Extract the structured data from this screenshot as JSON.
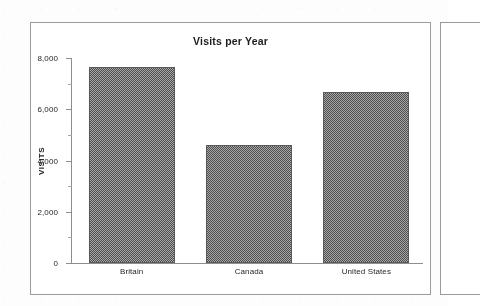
{
  "document": {
    "kind": "scanned-bar-chart",
    "frame_border_color": "#9b9b9b",
    "paper_color": "#fdfdfd"
  },
  "chart_data": {
    "type": "bar",
    "title": "Visits per Year",
    "xlabel": "",
    "ylabel": "VISITS",
    "categories": [
      "Britain",
      "Canada",
      "United States"
    ],
    "values": [
      7630,
      4600,
      6670
    ],
    "ylim": [
      0,
      8000
    ],
    "ytick_labels": [
      "0",
      "2,000",
      "4,000",
      "6,000",
      "8,000"
    ],
    "ytick_values": [
      0,
      2000,
      4000,
      6000,
      8000
    ],
    "yminor_values": [
      1000,
      3000,
      5000,
      7000
    ],
    "grid": false,
    "legend": false,
    "bar_fill": "#a9a9a9",
    "bar_edge": "#5a5a5a",
    "axis_color": "#8e8e8e"
  },
  "panels": {
    "main_label": "chart-panel",
    "next_label": "next-page-panel"
  }
}
